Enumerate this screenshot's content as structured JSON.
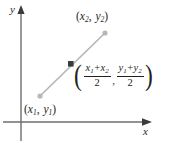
{
  "figure": {
    "background_color": "#ffffff",
    "ink_color": "#231f20",
    "segment_color": "#b5b7b9",
    "endpoint_color": "#b5b7b9",
    "midpoint_color": "#3b3b3d",
    "axis_color": "#6d6e71"
  },
  "axes": {
    "y_label": "y",
    "x_label": "x",
    "origin": {
      "x": 21,
      "y": 122
    }
  },
  "points": {
    "p1": {
      "open_paren": "(",
      "x_var": "x",
      "x_sub": "1",
      "comma": ",",
      "y_var": "y",
      "y_sub": "1",
      "close_paren": ")",
      "coords": {
        "x": 40,
        "y": 96
      }
    },
    "p2": {
      "open_paren": "(",
      "x_var": "x",
      "x_sub": "2",
      "comma": ",",
      "y_var": "y",
      "y_sub": "2",
      "close_paren": ")",
      "coords": {
        "x": 105,
        "y": 33
      }
    },
    "midpoint": {
      "coords": {
        "x": 71,
        "y": 64
      }
    }
  },
  "midpoint_formula": {
    "open_paren": "(",
    "close_paren": ")",
    "separator": ",",
    "term_x": {
      "numerator_first": "x",
      "numerator_first_sub": "1",
      "operator": "+",
      "numerator_second": "x",
      "numerator_second_sub": "2",
      "denominator": "2"
    },
    "term_y": {
      "numerator_first": "y",
      "numerator_first_sub": "1",
      "operator": "+",
      "numerator_second": "y",
      "numerator_second_sub": "2",
      "denominator": "2"
    }
  }
}
